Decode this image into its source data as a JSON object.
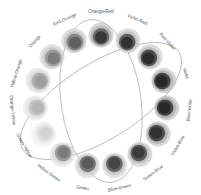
{
  "diagram": {
    "type": "color-wheel",
    "center": [
      101,
      101
    ],
    "swatch_radius": 66,
    "label_radius": 89,
    "hues": [
      {
        "label": "Orange-Red",
        "angle": 0,
        "outer": "#b8b8b8",
        "mid": "#6a6a6a",
        "inner": "#2e2e2e"
      },
      {
        "label": "Violet-Red",
        "angle": 24,
        "outer": "#c4c4c4",
        "mid": "#5e5e5e",
        "inner": "#2a2a2a"
      },
      {
        "label": "Red-Violet",
        "angle": 48,
        "outer": "#bdbdbd",
        "mid": "#4e4e4e",
        "inner": "#262626"
      },
      {
        "label": "Violet",
        "angle": 72,
        "outer": "#b5b5b5",
        "mid": "#444444",
        "inner": "#222222"
      },
      {
        "label": "Blue-Violet",
        "angle": 96,
        "outer": "#b0b0b0",
        "mid": "#454545",
        "inner": "#232323"
      },
      {
        "label": "Violet-Blue",
        "angle": 120,
        "outer": "#b5b5b5",
        "mid": "#4c4c4c",
        "inner": "#2c2c2c"
      },
      {
        "label": "Green-Blue",
        "angle": 144,
        "outer": "#c0c0c0",
        "mid": "#5c5c5c",
        "inner": "#353535"
      },
      {
        "label": "Blue-Green",
        "angle": 168,
        "outer": "#c8c8c8",
        "mid": "#666666",
        "inner": "#404040"
      },
      {
        "label": "Green",
        "angle": 192,
        "outer": "#cfcfcf",
        "mid": "#7a7a7a",
        "inner": "#555555"
      },
      {
        "label": "Yellow-Green",
        "angle": 216,
        "outer": "#dadada",
        "mid": "#9a9a9a",
        "inner": "#777777"
      },
      {
        "label": "Green-Yellow",
        "angle": 240,
        "outer": "#ececec",
        "mid": "#dedede",
        "inner": "#d2d2d2"
      },
      {
        "label": "Orange-Yellow",
        "angle": 264,
        "outer": "#e2e2e2",
        "mid": "#c4c4c4",
        "inner": "#b4b4b4"
      },
      {
        "label": "Yellow-Orange",
        "angle": 288,
        "outer": "#d8d8d8",
        "mid": "#b0b0b0",
        "inner": "#9a9a9a"
      },
      {
        "label": "Orange",
        "angle": 312,
        "outer": "#cccccc",
        "mid": "#9a9a9a",
        "inner": "#777777"
      },
      {
        "label": "Red-Orange",
        "angle": 336,
        "outer": "#c4c4c4",
        "mid": "#858585",
        "inner": "#5a5a5a"
      }
    ],
    "connectors": [
      {
        "name": "ellipse-a",
        "rx": 40,
        "ry": 82,
        "rotate": -8
      },
      {
        "name": "ellipse-b",
        "rx": 92,
        "ry": 38,
        "rotate": -32
      }
    ],
    "line_color": "#a8a8a8"
  }
}
